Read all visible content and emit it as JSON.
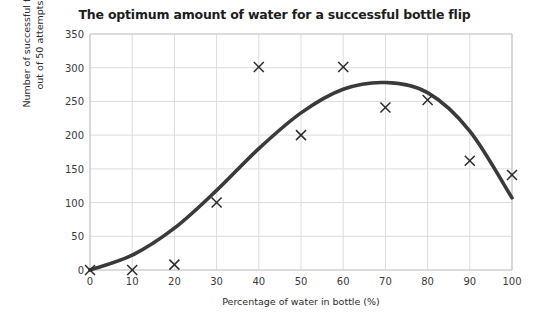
{
  "chart_data": {
    "type": "scatter",
    "title": "The optimum amount of water for a successful bottle flip",
    "xlabel": "Percentage of water in bottle (%)",
    "ylabel_line1": "Number of successful flips",
    "ylabel_line2": "out of 50 attempts",
    "x": [
      0,
      10,
      20,
      30,
      40,
      50,
      60,
      70,
      80,
      90,
      100
    ],
    "values": [
      0,
      0,
      8,
      100,
      301,
      200,
      301,
      241,
      252,
      162,
      141
    ],
    "series": [
      {
        "name": "Measured flips",
        "marker": "x",
        "values": [
          0,
          0,
          8,
          100,
          301,
          200,
          301,
          241,
          252,
          162,
          141
        ]
      },
      {
        "name": "Line of best fit",
        "marker": "none",
        "x": [
          0,
          10,
          20,
          30,
          40,
          50,
          60,
          70,
          80,
          90,
          100
        ],
        "values": [
          0,
          22,
          62,
          118,
          180,
          233,
          268,
          278,
          263,
          206,
          107
        ]
      }
    ],
    "xlim": [
      0,
      100
    ],
    "ylim": [
      0,
      350
    ],
    "xticks": [
      0,
      10,
      20,
      30,
      40,
      50,
      60,
      70,
      80,
      90,
      100
    ],
    "yticks": [
      0,
      50,
      100,
      150,
      200,
      250,
      300,
      350
    ],
    "grid": true,
    "legend": "none",
    "colors": {
      "curve": "#3a3a3a",
      "marker": "#2b2b2b",
      "grid": "#dcdcdc",
      "axis": "#c9c9c9",
      "title": "#1d1d1d",
      "background": "#ffffff"
    }
  }
}
